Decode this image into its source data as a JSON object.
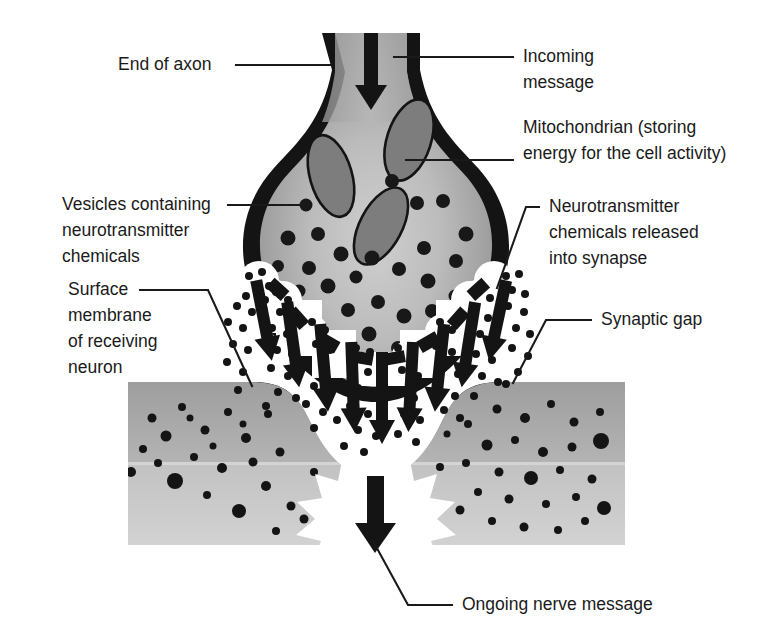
{
  "figure": {
    "background_color": "#ffffff",
    "ink_color": "#1a1a1a"
  },
  "labels": [
    {
      "id": "end-of-axon",
      "lines": [
        "End of axon"
      ],
      "text_x": 118,
      "text_y": 65,
      "anchor": "start",
      "leader": "M 236 65 L 330 65"
    },
    {
      "id": "incoming-message",
      "lines": [
        "Incoming",
        "message"
      ],
      "text_x": 523,
      "text_y": 57,
      "anchor": "start",
      "leader": "M 394 57 L 513 57"
    },
    {
      "id": "mitochondrian",
      "lines": [
        "Mitochondrian (storing",
        "energy for the cell activity)"
      ],
      "text_x": 523,
      "text_y": 128,
      "anchor": "start",
      "leader": "M 406 160 L 513 160"
    },
    {
      "id": "vesicles",
      "lines": [
        "Vesicles containing",
        "neurotransmitter",
        "chemicals"
      ],
      "text_x": 62,
      "text_y": 205,
      "anchor": "start",
      "leader": "M 228 205 L 303 205"
    },
    {
      "id": "neurotransmitter-released",
      "lines": [
        "Neurotransmitter",
        "chemicals released",
        "into synapse"
      ],
      "text_x": 549,
      "text_y": 207,
      "anchor": "start",
      "leader": "M 539 207 L 526 207 L 497 288"
    },
    {
      "id": "surface-membrane",
      "lines": [
        "Surface",
        "membrane",
        "of receiving",
        "neuron"
      ],
      "text_x": 68,
      "text_y": 290,
      "anchor": "start",
      "leader": "M 140 290 L 208 290 L 252 386"
    },
    {
      "id": "synaptic-gap",
      "lines": [
        "Synaptic gap"
      ],
      "text_x": 601,
      "text_y": 320,
      "anchor": "start",
      "leader": "M 591 320 L 546 320 L 513 383"
    },
    {
      "id": "ongoing-nerve-message",
      "lines": [
        "Ongoing nerve message"
      ],
      "text_x": 462,
      "text_y": 605,
      "anchor": "start",
      "leader": "M 452 605 L 408 605 L 373 541"
    }
  ],
  "structures": {
    "axon_terminal": {
      "name": "End of axon (presynaptic terminal)",
      "membrane_color": "#141414",
      "cytoplasm_light": "#bdbdbd",
      "cytoplasm_dark": "#8f8f8f"
    },
    "mitochondria": {
      "name": "Mitochondrian",
      "count": 3,
      "fill": "#7d7d7d",
      "stroke": "#141414"
    },
    "vesicles": {
      "name": "Vesicles containing neurotransmitter chemicals",
      "fill": "#181818",
      "count": 34
    },
    "released_vesicles": {
      "name": "Vesicles fusing and releasing into synapse",
      "fill": "#ffffff",
      "count": 9
    },
    "synaptic_gap": {
      "name": "Synaptic gap",
      "fill": "#ffffff"
    },
    "neurotransmitter_dots": {
      "name": "Neurotransmitter chemicals in synapse",
      "fill": "#141414"
    },
    "receiving_neuron": {
      "name": "Surface membrane of receiving neuron",
      "membrane_color": "#141414",
      "body_light": "#c6c6c6",
      "body_dark": "#9a9a9a"
    },
    "burst": {
      "name": "Ongoing nerve message burst",
      "fill": "#ffffff"
    },
    "arrows": {
      "name": "Signal direction arrows",
      "fill": "#141414",
      "incoming_count": 1,
      "cleft_count": 9,
      "outgoing_count": 1
    }
  }
}
